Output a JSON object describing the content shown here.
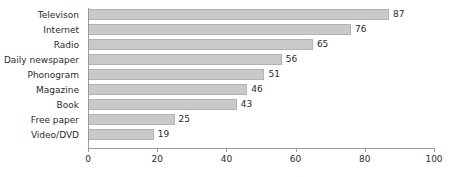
{
  "chart_data": {
    "type": "bar",
    "orientation": "horizontal",
    "title": "",
    "xlabel": "",
    "ylabel": "",
    "xlim": [
      0,
      100
    ],
    "xticks": [
      0,
      20,
      40,
      60,
      80,
      100
    ],
    "grid": false,
    "legend": null,
    "bar_color": "#c9c9c9",
    "bar_border_color": "#b2b2b2",
    "axis_color": "#9a9a9a",
    "background": "#ffffff",
    "categories": [
      "Televison",
      "Internet",
      "Radio",
      "Daily newspaper",
      "Phonogram",
      "Magazine",
      "Book",
      "Free paper",
      "Video/DVD"
    ],
    "values": [
      87,
      76,
      65,
      56,
      51,
      46,
      43,
      25,
      19
    ],
    "data_labels": [
      "87",
      "76",
      "65",
      "56",
      "51",
      "46",
      "43",
      "25",
      "19"
    ],
    "tick_labels": [
      "0",
      "20",
      "40",
      "60",
      "80",
      "100"
    ]
  }
}
